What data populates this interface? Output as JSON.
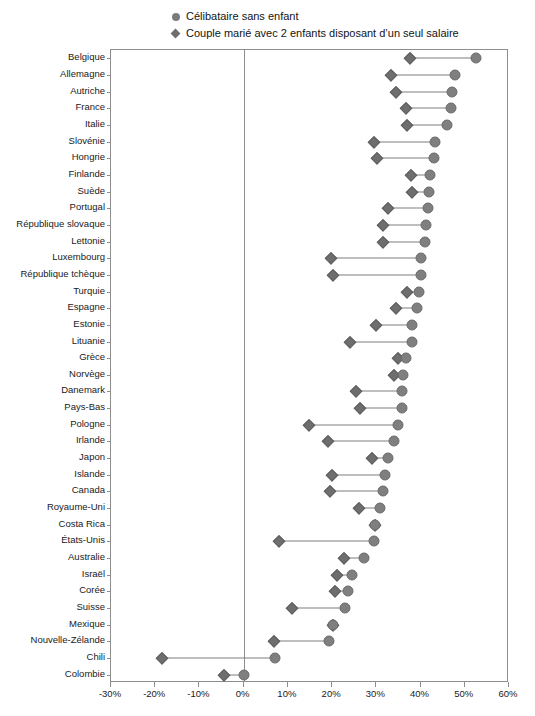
{
  "legend": {
    "items": [
      {
        "label": "Célibataire sans enfant",
        "marker": "circle-icon",
        "color": "#7b7b7b"
      },
      {
        "label": "Couple marié avec 2 enfants disposant d’un seul salaire",
        "marker": "diamond-icon",
        "color": "#6e6e6e"
      }
    ]
  },
  "axis": {
    "tick_labels": [
      "-30%",
      "-20%",
      "-10%",
      "0%",
      "10%",
      "20%",
      "30%",
      "40%",
      "50%",
      "60%"
    ]
  },
  "chart_data": {
    "type": "scatter",
    "subtype": "dumbbell",
    "title": "",
    "subtitle": "",
    "xlabel": "",
    "ylabel": "",
    "xlim": [
      -30,
      60
    ],
    "xtick_values": [
      -30,
      -20,
      -10,
      0,
      10,
      20,
      30,
      40,
      50,
      60
    ],
    "xtick_labels": [
      "-30%",
      "-20%",
      "-10%",
      "0%",
      "10%",
      "20%",
      "30%",
      "40%",
      "50%",
      "60%"
    ],
    "grid": false,
    "legend_position": "top",
    "unit": "percent",
    "categories": [
      "Belgique",
      "Allemagne",
      "Autriche",
      "France",
      "Italie",
      "Slovénie",
      "Hongrie",
      "Finlande",
      "Suède",
      "Portugal",
      "République slovaque",
      "Lettonie",
      "Luxembourg",
      "République tchèque",
      "Turquie",
      "Espagne",
      "Estonie",
      "Lituanie",
      "Grèce",
      "Norvège",
      "Danemark",
      "Pays-Bas",
      "Pologne",
      "Irlande",
      "Japon",
      "Islande",
      "Canada",
      "Royaume-Uni",
      "Costa Rica",
      "États-Unis",
      "Australie",
      "Israël",
      "Corée",
      "Suisse",
      "Mexique",
      "Nouvelle-Zélande",
      "Chili",
      "Colombie"
    ],
    "series": [
      {
        "name": "Célibataire sans enfant",
        "marker": "circle",
        "color": "#7f7f7f",
        "values": [
          52.6,
          47.8,
          47.2,
          46.8,
          45.9,
          43.2,
          43.0,
          42.1,
          42.0,
          41.6,
          41.3,
          40.9,
          40.2,
          40.1,
          39.7,
          39.3,
          38.0,
          38.0,
          36.8,
          36.0,
          35.9,
          35.7,
          34.8,
          34.0,
          32.6,
          32.0,
          31.5,
          30.8,
          29.6,
          29.5,
          27.1,
          24.6,
          23.7,
          22.9,
          20.2,
          19.4,
          7.0,
          0.0
        ]
      },
      {
        "name": "Couple marié avec 2 enfants disposant d’un seul salaire",
        "marker": "diamond",
        "color": "#6e6e6e",
        "values": [
          37.6,
          33.3,
          34.4,
          36.8,
          37.0,
          29.5,
          30.2,
          37.9,
          38.0,
          32.6,
          31.6,
          31.4,
          19.7,
          20.3,
          36.9,
          34.4,
          30.0,
          24.0,
          34.8,
          33.9,
          25.5,
          26.2,
          14.8,
          19.0,
          29.0,
          19.9,
          19.5,
          26.1,
          29.6,
          7.9,
          22.8,
          21.0,
          20.6,
          11.0,
          20.2,
          6.8,
          -18.5,
          -4.5
        ]
      }
    ]
  }
}
